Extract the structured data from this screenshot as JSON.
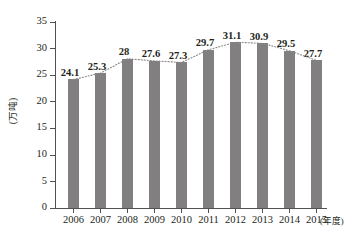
{
  "chart_data": {
    "type": "bar",
    "title": "",
    "xlabel": "(年度)",
    "ylabel": "(万吨)",
    "categories": [
      "2006",
      "2007",
      "2008",
      "2009",
      "2010",
      "2011",
      "2012",
      "2013",
      "2014",
      "2015"
    ],
    "values": [
      24.1,
      25.3,
      28,
      27.6,
      27.3,
      29.7,
      31.1,
      30.9,
      29.5,
      27.7
    ],
    "value_labels": [
      "24.1",
      "25.3",
      "28",
      "27.6",
      "27.3",
      "29.7",
      "31.1",
      "30.9",
      "29.5",
      "27.7"
    ],
    "ylim": [
      0,
      35
    ],
    "ytick_values": [
      0,
      5,
      10,
      15,
      20,
      25,
      30,
      35
    ],
    "ytick_labels": [
      "0",
      "5",
      "10",
      "15",
      "20",
      "25",
      "30",
      "35"
    ],
    "grid": false,
    "legend": null,
    "series": [
      {
        "name": "bars",
        "type": "bar",
        "values": [
          24.1,
          25.3,
          28,
          27.6,
          27.3,
          29.7,
          31.1,
          30.9,
          29.5,
          27.7
        ],
        "color": "#817f80"
      },
      {
        "name": "trend",
        "type": "line",
        "style": "dotted",
        "values": [
          24.1,
          25.3,
          28,
          27.6,
          27.3,
          29.7,
          31.1,
          30.9,
          29.5,
          27.7
        ],
        "color": "#8a8788"
      }
    ],
    "colors": {
      "bar": "#817f80",
      "trend_line": "#8a8788",
      "axis": "#555152",
      "text": "#231f20",
      "background": "#ffffff"
    }
  }
}
